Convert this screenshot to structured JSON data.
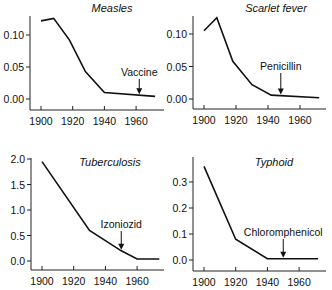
{
  "chart_data": [
    {
      "type": "line",
      "title": "Measles",
      "xlabel": "",
      "ylabel": "",
      "x": [
        1900,
        1908,
        1918,
        1928,
        1940,
        1972
      ],
      "values": [
        0.122,
        0.126,
        0.092,
        0.043,
        0.01,
        0.004
      ],
      "xticks": [
        1900,
        1920,
        1940,
        1960
      ],
      "yticks": [
        0.0,
        0.05,
        0.1
      ],
      "ytick_labels": [
        "0.00",
        "0.05",
        "0.10"
      ],
      "xlim": [
        1897,
        1973
      ],
      "ylim": [
        -0.006,
        0.13
      ],
      "annotation": {
        "text": "Vaccine",
        "x": 1962
      },
      "grid": false
    },
    {
      "type": "line",
      "title": "Scarlet fever",
      "xlabel": "",
      "ylabel": "",
      "x": [
        1900,
        1908,
        1918,
        1930,
        1942,
        1972
      ],
      "values": [
        0.105,
        0.125,
        0.058,
        0.022,
        0.006,
        0.002
      ],
      "xticks": [
        1900,
        1920,
        1940,
        1960
      ],
      "yticks": [
        0.0,
        0.05,
        0.1
      ],
      "ytick_labels": [
        "0.00",
        "0.05",
        "0.10"
      ],
      "xlim": [
        1893,
        1976
      ],
      "ylim": [
        -0.006,
        0.13
      ],
      "annotation": {
        "text": "Penicillin",
        "x": 1948
      },
      "grid": false
    },
    {
      "type": "line",
      "title": "Tuberculosis",
      "xlabel": "",
      "ylabel": "",
      "x": [
        1900,
        1930,
        1950,
        1960,
        1974
      ],
      "values": [
        1.95,
        0.6,
        0.2,
        0.04,
        0.04
      ],
      "xticks": [
        1900,
        1920,
        1940,
        1960
      ],
      "yticks": [
        0.0,
        0.5,
        1.0,
        1.5,
        2.0
      ],
      "ytick_labels": [
        "0.0",
        "0.5",
        "1.0",
        "1.5",
        "2.0"
      ],
      "xlim": [
        1893,
        1976
      ],
      "ylim": [
        -0.2,
        2.0
      ],
      "annotation": {
        "text": "Izoniozid",
        "x": 1950
      },
      "grid": false
    },
    {
      "type": "line",
      "title": "Typhoid",
      "xlabel": "",
      "ylabel": "",
      "x": [
        1900,
        1920,
        1940,
        1972
      ],
      "values": [
        0.36,
        0.08,
        0.005,
        0.005
      ],
      "xticks": [
        1900,
        1920,
        1940,
        1960
      ],
      "yticks": [
        0.0,
        0.1,
        0.2,
        0.3
      ],
      "ytick_labels": [
        "0.0",
        "0.1",
        "0.2",
        "0.3"
      ],
      "xlim": [
        1893,
        1976
      ],
      "ylim": [
        -0.04,
        0.4
      ],
      "annotation": {
        "text": "Chloromphenicol",
        "x": 1950
      },
      "grid": false
    }
  ],
  "panels": [
    {
      "title": "Measles",
      "annotation": "Vaccine"
    },
    {
      "title": "Scarlet fever",
      "annotation": "Penicillin"
    },
    {
      "title": "Tuberculosis",
      "annotation": "Izoniozid"
    },
    {
      "title": "Typhoid",
      "annotation": "Chloromphenicol"
    }
  ]
}
